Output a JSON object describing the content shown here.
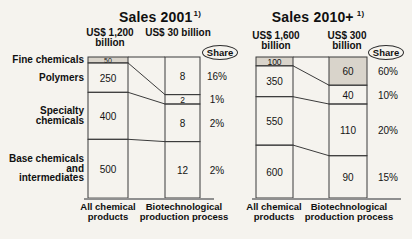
{
  "colors": {
    "background": "#f5f3ee",
    "line": "#3b3b3b",
    "baseline": "#8f8f8f",
    "shaded_fill": "#d9d4cb",
    "text": "#141414"
  },
  "row_labels": [
    {
      "lines": [
        "Fine chemicals"
      ]
    },
    {
      "lines": [
        "Polymers"
      ]
    },
    {
      "lines": [
        "Specialty",
        "chemicals"
      ]
    },
    {
      "lines": [
        "Base chemicals",
        "and",
        "intermediates"
      ]
    }
  ],
  "chart_data": [
    {
      "type": "bar",
      "subtype": "stacked-column-flow",
      "title": "Sales 2001",
      "footnote_marker": "1)",
      "share_label": "Share",
      "categories": [
        "Fine chemicals",
        "Polymers",
        "Specialty chemicals",
        "Base chemicals and intermediates"
      ],
      "columns": [
        {
          "header": [
            "US$ 1,200",
            "billion"
          ],
          "axis_label_lines": [
            "All chemical",
            "products"
          ],
          "total": 1200,
          "values": [
            50,
            250,
            400,
            500
          ],
          "shaded_segments": [
            0
          ]
        },
        {
          "header": [
            "US$ 30 billion"
          ],
          "axis_label_lines": [
            "Biotechnological",
            "production process"
          ],
          "total": 30,
          "values": [
            8,
            2,
            8,
            12
          ],
          "shaded_segments": []
        }
      ],
      "share_values": [
        "16%",
        "1%",
        "2%",
        "2%"
      ]
    },
    {
      "type": "bar",
      "subtype": "stacked-column-flow",
      "title": "Sales 2010+",
      "footnote_marker": "1)",
      "share_label": "Share",
      "categories": [
        "Fine chemicals",
        "Polymers",
        "Specialty chemicals",
        "Base chemicals and intermediates"
      ],
      "columns": [
        {
          "header": [
            "US$ 1,600",
            "billion"
          ],
          "axis_label_lines": [
            "All chemical",
            "products"
          ],
          "total": 1600,
          "values": [
            100,
            350,
            550,
            600
          ],
          "shaded_segments": [
            0
          ]
        },
        {
          "header": [
            "US$ 300",
            "billion"
          ],
          "axis_label_lines": [
            "Biotechnological",
            "production process"
          ],
          "total": 300,
          "values": [
            60,
            40,
            110,
            90
          ],
          "shaded_segments": [
            0
          ]
        }
      ],
      "share_values": [
        "60%",
        "10%",
        "20%",
        "15%"
      ]
    }
  ]
}
